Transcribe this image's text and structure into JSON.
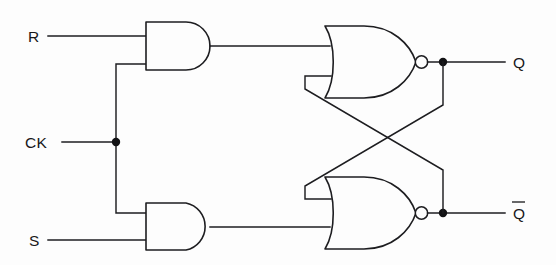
{
  "diagram": {
    "background_color": "#fdfdfd",
    "line_color": "#1d1d20"
  },
  "labels": {
    "input_r": "R",
    "input_ck": "CK",
    "input_s": "S",
    "output_q": "Q",
    "output_qbar": "Q",
    "output_qbar_overbar": true
  },
  "gates": [
    {
      "id": "and-top",
      "type": "AND",
      "inputs": [
        "R",
        "CK"
      ],
      "output_to": "nor-top"
    },
    {
      "id": "and-bottom",
      "type": "AND",
      "inputs": [
        "CK",
        "S"
      ],
      "output_to": "nor-bottom"
    },
    {
      "id": "nor-top",
      "type": "NOR",
      "inputs": [
        "and-top",
        "qbar-feedback"
      ],
      "output_to": "Q"
    },
    {
      "id": "nor-bottom",
      "type": "NOR",
      "inputs": [
        "q-feedback",
        "and-bottom"
      ],
      "output_to": "Qbar"
    }
  ],
  "nodes": [
    {
      "id": "ck-junction",
      "x": 116,
      "y": 142
    },
    {
      "id": "q-junction",
      "x": 443,
      "y": 62
    },
    {
      "id": "qbar-junction",
      "x": 443,
      "y": 213
    }
  ]
}
